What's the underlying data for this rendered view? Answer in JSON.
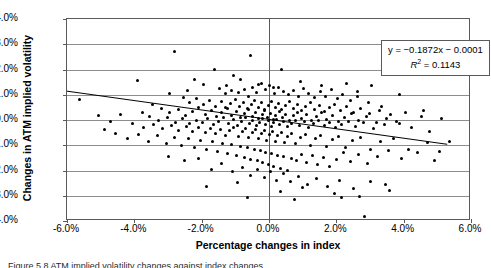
{
  "figure": {
    "caption": "Figure 5.8   ATM implied volatility changes against index changes"
  },
  "chart_data": {
    "type": "scatter",
    "title": "",
    "xlabel": "Percentage changes in index",
    "ylabel": "Changes in ATM implied volatility",
    "xlim": [
      -6.0,
      6.0
    ],
    "ylim": [
      -4.0,
      4.0
    ],
    "xticks": [
      "-6.0%",
      "-4.0%",
      "-2.0%",
      "0.0%",
      "2.0%",
      "4.0%",
      "6.0%"
    ],
    "xtick_values": [
      -6.0,
      -4.0,
      -2.0,
      0.0,
      2.0,
      4.0,
      6.0
    ],
    "yticks": [
      "4.0%",
      "3.0%",
      "2.0%",
      "1.0%",
      "0.0%",
      "-1.0%",
      "-2.0%",
      "-3.0%",
      "-4.0%"
    ],
    "ytick_values": [
      4.0,
      3.0,
      2.0,
      1.0,
      0.0,
      -1.0,
      -2.0,
      -3.0,
      -4.0
    ],
    "grid": "horizontal",
    "legend": "none",
    "point_color": "#000000",
    "trendline": {
      "slope": -0.1872,
      "intercept": -0.0001,
      "r_squared": 0.1143,
      "equation": "y = −0.1872x − 0.0001",
      "r2_label": "R",
      "r2_exp": "2",
      "r2_value": " = 0.1143",
      "x_start": -6.0,
      "x_end": 5.35,
      "color": "#000000"
    },
    "annotations": [
      {
        "text": "y = −0.1872x − 0.0001"
      },
      {
        "text": "R² = 0.1143"
      }
    ],
    "points": [
      [
        -5.62,
        0.8
      ],
      [
        -3.9,
        1.55
      ],
      [
        -2.82,
        2.7
      ],
      [
        -2.22,
        1.6
      ],
      [
        -1.62,
        2.0
      ],
      [
        -1.05,
        1.75
      ],
      [
        -0.55,
        2.55
      ],
      [
        0.38,
        2.0
      ],
      [
        -0.3,
        1.42
      ],
      [
        0.12,
        1.3
      ],
      [
        2.3,
        1.45
      ],
      [
        3.05,
        1.35
      ],
      [
        -1.25,
        1.35
      ],
      [
        -1.48,
        1.25
      ],
      [
        -1.3,
        1.05
      ],
      [
        -1.12,
        1.15
      ],
      [
        -0.92,
        1.08
      ],
      [
        -0.74,
        1.22
      ],
      [
        -0.6,
        0.95
      ],
      [
        -0.48,
        1.3
      ],
      [
        -0.36,
        1.1
      ],
      [
        -0.22,
        1.45
      ],
      [
        -0.1,
        1.2
      ],
      [
        0.02,
        1.35
      ],
      [
        0.16,
        1.05
      ],
      [
        0.28,
        1.28
      ],
      [
        0.42,
        1.12
      ],
      [
        0.58,
        1.0
      ],
      [
        0.72,
        1.18
      ],
      [
        0.88,
        0.92
      ],
      [
        1.02,
        1.25
      ],
      [
        1.18,
        1.05
      ],
      [
        1.36,
        0.88
      ],
      [
        1.52,
        1.12
      ],
      [
        1.68,
        0.95
      ],
      [
        1.85,
        1.2
      ],
      [
        2.02,
        0.85
      ],
      [
        2.18,
        1.02
      ],
      [
        2.42,
        0.78
      ],
      [
        2.62,
        0.92
      ],
      [
        2.95,
        0.7
      ],
      [
        3.35,
        0.55
      ],
      [
        -2.55,
        0.9
      ],
      [
        -2.35,
        0.7
      ],
      [
        -2.15,
        0.85
      ],
      [
        -1.95,
        0.62
      ],
      [
        -1.78,
        0.78
      ],
      [
        -1.6,
        0.55
      ],
      [
        -1.42,
        0.72
      ],
      [
        -1.28,
        0.48
      ],
      [
        -1.15,
        0.65
      ],
      [
        -1.0,
        0.82
      ],
      [
        -0.88,
        0.52
      ],
      [
        -0.76,
        0.7
      ],
      [
        -0.64,
        0.45
      ],
      [
        -0.52,
        0.62
      ],
      [
        -0.42,
        0.78
      ],
      [
        -0.32,
        0.5
      ],
      [
        -0.22,
        0.68
      ],
      [
        -0.12,
        0.42
      ],
      [
        -0.02,
        0.58
      ],
      [
        0.08,
        0.75
      ],
      [
        0.18,
        0.48
      ],
      [
        0.28,
        0.65
      ],
      [
        0.38,
        0.4
      ],
      [
        0.48,
        0.58
      ],
      [
        0.6,
        0.72
      ],
      [
        0.72,
        0.45
      ],
      [
        0.84,
        0.62
      ],
      [
        0.96,
        0.38
      ],
      [
        1.08,
        0.55
      ],
      [
        1.22,
        0.68
      ],
      [
        1.36,
        0.42
      ],
      [
        1.5,
        0.58
      ],
      [
        1.64,
        0.35
      ],
      [
        1.8,
        0.5
      ],
      [
        1.96,
        0.62
      ],
      [
        2.12,
        0.38
      ],
      [
        2.3,
        0.52
      ],
      [
        2.5,
        0.3
      ],
      [
        2.72,
        0.44
      ],
      [
        2.98,
        0.25
      ],
      [
        3.28,
        0.38
      ],
      [
        3.62,
        0.2
      ],
      [
        4.05,
        0.3
      ],
      [
        4.52,
        0.12
      ],
      [
        -3.18,
        0.45
      ],
      [
        -2.95,
        0.28
      ],
      [
        -2.7,
        0.4
      ],
      [
        -2.48,
        0.18
      ],
      [
        -2.28,
        0.32
      ],
      [
        -2.08,
        0.5
      ],
      [
        -1.9,
        0.22
      ],
      [
        -1.72,
        0.38
      ],
      [
        -1.56,
        0.15
      ],
      [
        -1.4,
        0.3
      ],
      [
        -1.24,
        0.45
      ],
      [
        -1.1,
        0.18
      ],
      [
        -0.98,
        0.32
      ],
      [
        -0.86,
        0.08
      ],
      [
        -0.74,
        0.25
      ],
      [
        -0.62,
        0.4
      ],
      [
        -0.5,
        0.12
      ],
      [
        -0.4,
        0.28
      ],
      [
        -0.3,
        0.05
      ],
      [
        -0.2,
        0.22
      ],
      [
        -0.12,
        0.36
      ],
      [
        -0.04,
        0.1
      ],
      [
        0.04,
        0.26
      ],
      [
        0.12,
        0.02
      ],
      [
        0.2,
        0.18
      ],
      [
        0.3,
        0.34
      ],
      [
        0.4,
        0.08
      ],
      [
        0.5,
        0.22
      ],
      [
        0.62,
        0.0
      ],
      [
        0.74,
        0.16
      ],
      [
        0.86,
        0.3
      ],
      [
        0.98,
        0.05
      ],
      [
        1.12,
        0.2
      ],
      [
        1.26,
        -0.02
      ],
      [
        1.4,
        0.14
      ],
      [
        1.56,
        0.28
      ],
      [
        1.72,
        0.02
      ],
      [
        1.88,
        0.16
      ],
      [
        2.06,
        -0.05
      ],
      [
        2.24,
        0.1
      ],
      [
        2.44,
        0.24
      ],
      [
        2.66,
        -0.02
      ],
      [
        2.9,
        0.12
      ],
      [
        3.18,
        -0.08
      ],
      [
        3.5,
        0.05
      ],
      [
        3.88,
        -0.12
      ],
      [
        -3.55,
        0.15
      ],
      [
        -3.28,
        -0.02
      ],
      [
        -3.02,
        0.1
      ],
      [
        -2.78,
        -0.08
      ],
      [
        -2.56,
        0.05
      ],
      [
        -2.36,
        -0.15
      ],
      [
        -2.16,
        0.0
      ],
      [
        -1.98,
        -0.1
      ],
      [
        -1.82,
        0.06
      ],
      [
        -1.66,
        -0.18
      ],
      [
        -1.5,
        -0.04
      ],
      [
        -1.35,
        0.08
      ],
      [
        -1.2,
        -0.12
      ],
      [
        -1.06,
        0.02
      ],
      [
        -0.94,
        -0.2
      ],
      [
        -0.82,
        -0.06
      ],
      [
        -0.7,
        0.08
      ],
      [
        -0.58,
        -0.14
      ],
      [
        -0.48,
        0.0
      ],
      [
        -0.38,
        -0.22
      ],
      [
        -0.28,
        -0.08
      ],
      [
        -0.18,
        0.04
      ],
      [
        -0.1,
        -0.16
      ],
      [
        -0.02,
        -0.02
      ],
      [
        0.06,
        -0.24
      ],
      [
        0.14,
        -0.1
      ],
      [
        0.22,
        0.02
      ],
      [
        0.32,
        -0.18
      ],
      [
        0.42,
        -0.04
      ],
      [
        0.54,
        -0.26
      ],
      [
        0.66,
        -0.12
      ],
      [
        0.78,
        0.0
      ],
      [
        0.9,
        -0.2
      ],
      [
        1.04,
        -0.06
      ],
      [
        1.18,
        -0.28
      ],
      [
        1.32,
        -0.14
      ],
      [
        1.48,
        -0.02
      ],
      [
        1.64,
        -0.22
      ],
      [
        1.8,
        -0.08
      ],
      [
        1.98,
        -0.3
      ],
      [
        2.16,
        -0.16
      ],
      [
        2.36,
        -0.04
      ],
      [
        2.58,
        -0.24
      ],
      [
        2.82,
        -0.1
      ],
      [
        3.1,
        -0.32
      ],
      [
        3.42,
        -0.18
      ],
      [
        3.78,
        -0.06
      ],
      [
        4.22,
        -0.28
      ],
      [
        -4.05,
        -0.15
      ],
      [
        -3.72,
        -0.3
      ],
      [
        -3.42,
        -0.18
      ],
      [
        -3.15,
        -0.35
      ],
      [
        -2.9,
        -0.22
      ],
      [
        -2.68,
        -0.4
      ],
      [
        -2.46,
        -0.26
      ],
      [
        -2.26,
        -0.45
      ],
      [
        -2.08,
        -0.3
      ],
      [
        -1.9,
        -0.5
      ],
      [
        -1.74,
        -0.34
      ],
      [
        -1.58,
        -0.55
      ],
      [
        -1.44,
        -0.38
      ],
      [
        -1.3,
        -0.6
      ],
      [
        -1.16,
        -0.42
      ],
      [
        -1.04,
        -0.28
      ],
      [
        -0.92,
        -0.65
      ],
      [
        -0.8,
        -0.46
      ],
      [
        -0.7,
        -0.32
      ],
      [
        -0.6,
        -0.7
      ],
      [
        -0.5,
        -0.5
      ],
      [
        -0.4,
        -0.36
      ],
      [
        -0.3,
        -0.75
      ],
      [
        -0.22,
        -0.54
      ],
      [
        -0.14,
        -0.4
      ],
      [
        -0.06,
        -0.8
      ],
      [
        0.02,
        -0.58
      ],
      [
        0.1,
        -0.44
      ],
      [
        0.18,
        -0.85
      ],
      [
        0.26,
        -0.62
      ],
      [
        0.36,
        -0.48
      ],
      [
        0.46,
        -0.9
      ],
      [
        0.56,
        -0.66
      ],
      [
        0.68,
        -0.52
      ],
      [
        0.8,
        -0.95
      ],
      [
        0.94,
        -0.7
      ],
      [
        1.08,
        -0.56
      ],
      [
        1.22,
        -1.0
      ],
      [
        1.38,
        -0.74
      ],
      [
        1.54,
        -0.6
      ],
      [
        1.7,
        -1.05
      ],
      [
        1.88,
        -0.78
      ],
      [
        2.06,
        -0.64
      ],
      [
        2.26,
        -1.1
      ],
      [
        2.48,
        -0.82
      ],
      [
        2.72,
        -0.68
      ],
      [
        3.0,
        -1.15
      ],
      [
        3.32,
        -0.86
      ],
      [
        3.7,
        -0.72
      ],
      [
        4.15,
        -1.18
      ],
      [
        4.7,
        -0.9
      ],
      [
        5.05,
        -1.25
      ],
      [
        -4.55,
        -0.55
      ],
      [
        -4.2,
        -0.72
      ],
      [
        -3.88,
        -0.58
      ],
      [
        -3.58,
        -0.85
      ],
      [
        -3.3,
        -0.62
      ],
      [
        -3.05,
        -0.95
      ],
      [
        -2.82,
        -0.68
      ],
      [
        -2.6,
        -1.02
      ],
      [
        -2.4,
        -0.74
      ],
      [
        -2.2,
        -1.1
      ],
      [
        -2.02,
        -0.8
      ],
      [
        -1.85,
        -1.18
      ],
      [
        -1.68,
        -0.86
      ],
      [
        -1.52,
        -1.25
      ],
      [
        -1.38,
        -0.92
      ],
      [
        -1.24,
        -1.32
      ],
      [
        -1.1,
        -0.98
      ],
      [
        -0.98,
        -1.4
      ],
      [
        -0.86,
        -1.04
      ],
      [
        -0.74,
        -1.48
      ],
      [
        -0.64,
        -1.1
      ],
      [
        -0.54,
        -1.55
      ],
      [
        -0.44,
        -1.16
      ],
      [
        -0.34,
        -1.62
      ],
      [
        -0.26,
        -1.22
      ],
      [
        -0.18,
        -1.7
      ],
      [
        -0.1,
        -1.28
      ],
      [
        -0.02,
        -1.78
      ],
      [
        0.06,
        -1.34
      ],
      [
        0.14,
        -1.85
      ],
      [
        0.24,
        -1.4
      ],
      [
        0.34,
        -1.92
      ],
      [
        0.44,
        -1.46
      ],
      [
        0.56,
        -2.0
      ],
      [
        0.68,
        -1.52
      ],
      [
        0.82,
        -1.6
      ],
      [
        0.96,
        -1.35
      ],
      [
        1.12,
        -1.68
      ],
      [
        1.28,
        -1.42
      ],
      [
        1.44,
        -1.76
      ],
      [
        1.62,
        -1.5
      ],
      [
        1.8,
        -1.84
      ],
      [
        2.0,
        -1.58
      ],
      [
        2.2,
        -1.3
      ],
      [
        2.42,
        -1.66
      ],
      [
        2.66,
        -1.38
      ],
      [
        2.92,
        -1.74
      ],
      [
        3.22,
        -1.46
      ],
      [
        3.56,
        -1.2
      ],
      [
        3.95,
        -1.54
      ],
      [
        4.4,
        -1.28
      ],
      [
        4.92,
        -1.62
      ],
      [
        -3.0,
        -1.45
      ],
      [
        -2.52,
        -1.6
      ],
      [
        -2.1,
        -1.52
      ],
      [
        -1.72,
        -1.95
      ],
      [
        -1.4,
        -1.72
      ],
      [
        -1.08,
        -2.05
      ],
      [
        -0.8,
        -1.88
      ],
      [
        -0.56,
        -2.18
      ],
      [
        -0.34,
        -1.96
      ],
      [
        -0.14,
        -2.28
      ],
      [
        0.04,
        -2.05
      ],
      [
        0.22,
        -2.38
      ],
      [
        0.42,
        -2.12
      ],
      [
        0.64,
        -2.45
      ],
      [
        0.88,
        -2.22
      ],
      [
        1.14,
        -2.55
      ],
      [
        1.42,
        -2.3
      ],
      [
        1.74,
        -2.62
      ],
      [
        2.1,
        -2.38
      ],
      [
        2.52,
        -2.7
      ],
      [
        3.0,
        -2.45
      ],
      [
        3.58,
        -2.78
      ],
      [
        -1.85,
        -2.62
      ],
      [
        -0.95,
        -2.48
      ],
      [
        0.35,
        -2.85
      ],
      [
        1.0,
        -2.68
      ],
      [
        1.95,
        -2.92
      ],
      [
        2.7,
        -3.02
      ],
      [
        -0.65,
        -3.05
      ],
      [
        0.75,
        -3.15
      ],
      [
        2.15,
        -3.08
      ],
      [
        3.45,
        -2.55
      ],
      [
        2.85,
        -3.82
      ],
      [
        -5.05,
        0.18
      ],
      [
        -4.72,
        -0.05
      ],
      [
        -4.4,
        0.22
      ],
      [
        -4.88,
        -0.38
      ],
      [
        5.35,
        -0.85
      ],
      [
        5.12,
        0.05
      ],
      [
        4.78,
        -0.45
      ],
      [
        4.58,
        0.38
      ],
      [
        -2.95,
        1.05
      ],
      [
        -3.45,
        0.62
      ],
      [
        -3.75,
        0.3
      ],
      [
        3.88,
        1.02
      ],
      [
        -1.95,
        1.42
      ],
      [
        -0.85,
        1.62
      ],
      [
        0.95,
        1.52
      ],
      [
        1.55,
        1.38
      ],
      [
        2.62,
        1.12
      ],
      [
        -2.42,
        1.18
      ]
    ]
  }
}
